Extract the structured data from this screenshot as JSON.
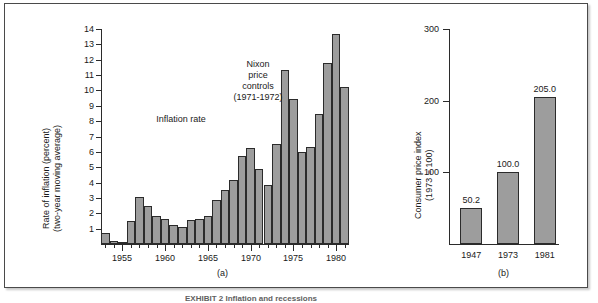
{
  "figure": {
    "caption": "EXHIBIT 2   Inflation and recessions",
    "panel_a_label": "(a)",
    "panel_b_label": "(b)"
  },
  "chart_data": [
    {
      "type": "bar",
      "id": "panel-a",
      "title": "",
      "xlabel": "",
      "ylabel": "Rate of inflation (percent)\n(two-year moving average)",
      "ylabel_line1": "Rate of inflation (percent)",
      "ylabel_line2": "(two-year moving average)",
      "ylim": [
        0,
        14
      ],
      "yticks": [
        1,
        2,
        3,
        4,
        5,
        6,
        7,
        8,
        9,
        10,
        11,
        12,
        13,
        14
      ],
      "ytick_labels": [
        "1",
        "2",
        "3",
        "4",
        "5",
        "6",
        "7",
        "8",
        "9",
        "10",
        "11",
        "12",
        "13",
        "14"
      ],
      "xlim": [
        1952.5,
        1981.5
      ],
      "xticks": [
        1955,
        1960,
        1965,
        1970,
        1975,
        1980
      ],
      "xtick_labels": [
        "1955",
        "1960",
        "1965",
        "1970",
        "1975",
        "1980"
      ],
      "grid": false,
      "legend": "none",
      "bar_color": "#9d9d9d",
      "categories": [
        "1953",
        "1954",
        "1955",
        "1956",
        "1957",
        "1958",
        "1959",
        "1960",
        "1961",
        "1962",
        "1963",
        "1964",
        "1965",
        "1966",
        "1967",
        "1968",
        "1969",
        "1970",
        "1971",
        "1972",
        "1973",
        "1974",
        "1975",
        "1976",
        "1977",
        "1978",
        "1979",
        "1980",
        "1981"
      ],
      "values": [
        0.7,
        0.2,
        0.15,
        1.5,
        3.05,
        2.45,
        1.8,
        1.6,
        1.25,
        1.1,
        1.55,
        1.6,
        1.8,
        2.9,
        3.5,
        4.2,
        5.75,
        6.25,
        4.9,
        3.85,
        6.5,
        11.35,
        9.45,
        6.0,
        6.35,
        8.45,
        11.8,
        13.7,
        10.2
      ],
      "annotations": [
        {
          "id": "inflation-rate",
          "text": "Inflation rate",
          "x": 1960.4,
          "y": 8.2
        },
        {
          "id": "nixon-price-controls",
          "lines": [
            "Nixon",
            "price",
            "controls",
            "(1971-1972)"
          ],
          "x": 1970.2,
          "y": 12.0
        }
      ]
    },
    {
      "type": "bar",
      "id": "panel-b",
      "title": "",
      "xlabel": "",
      "ylabel_line1": "Consumer price index",
      "ylabel_line2": "(1973 = 100)",
      "ylim": [
        0,
        300
      ],
      "yticks": [
        100,
        200,
        300
      ],
      "ytick_labels": [
        "100",
        "200",
        "300"
      ],
      "grid": false,
      "legend": "none",
      "bar_color": "#9d9d9d",
      "categories": [
        "1947",
        "1973",
        "1981"
      ],
      "values": [
        50.2,
        100.0,
        205.0
      ],
      "value_labels": [
        "50.2",
        "100.0",
        "205.0"
      ]
    }
  ]
}
